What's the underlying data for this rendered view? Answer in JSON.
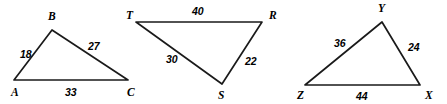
{
  "figure": {
    "background_color": "#ffffff",
    "stroke_color": "#1a1a1a",
    "text_color": "#000000",
    "width": 447,
    "height": 104
  },
  "triangles": [
    {
      "name": "triangle-abc",
      "vertices": [
        {
          "label": "A",
          "x": 14,
          "y": 80,
          "label_x": 11,
          "label_y": 96
        },
        {
          "label": "B",
          "x": 52,
          "y": 30,
          "label_x": 48,
          "label_y": 20
        },
        {
          "label": "C",
          "x": 128,
          "y": 80,
          "label_x": 127,
          "label_y": 96
        }
      ],
      "sides": [
        {
          "name": "side-ab",
          "value": "18",
          "label_x": 20,
          "label_y": 58
        },
        {
          "name": "side-bc",
          "value": "27",
          "label_x": 88,
          "label_y": 50
        },
        {
          "name": "side-ca",
          "value": "33",
          "label_x": 65,
          "label_y": 96
        }
      ],
      "stroke_width": 1.7
    },
    {
      "name": "triangle-trs",
      "vertices": [
        {
          "label": "T",
          "x": 136,
          "y": 22,
          "label_x": 126,
          "label_y": 19
        },
        {
          "label": "R",
          "x": 262,
          "y": 22,
          "label_x": 269,
          "label_y": 19
        },
        {
          "label": "S",
          "x": 222,
          "y": 84,
          "label_x": 218,
          "label_y": 99
        }
      ],
      "sides": [
        {
          "name": "side-tr",
          "value": "40",
          "label_x": 192,
          "label_y": 15
        },
        {
          "name": "side-ts",
          "value": "30",
          "label_x": 166,
          "label_y": 63
        },
        {
          "name": "side-rs",
          "value": "22",
          "label_x": 245,
          "label_y": 65
        }
      ],
      "stroke_width": 1.7
    },
    {
      "name": "triangle-yzx",
      "vertices": [
        {
          "label": "Y",
          "x": 382,
          "y": 22,
          "label_x": 378,
          "label_y": 12
        },
        {
          "label": "Z",
          "x": 305,
          "y": 85,
          "label_x": 297,
          "label_y": 99
        },
        {
          "label": "X",
          "x": 420,
          "y": 85,
          "label_x": 425,
          "label_y": 99
        }
      ],
      "sides": [
        {
          "name": "side-yz",
          "value": "36",
          "label_x": 334,
          "label_y": 47
        },
        {
          "name": "side-yx",
          "value": "24",
          "label_x": 408,
          "label_y": 51
        },
        {
          "name": "side-zx",
          "value": "44",
          "label_x": 356,
          "label_y": 100
        }
      ],
      "stroke_width": 1.7
    }
  ]
}
